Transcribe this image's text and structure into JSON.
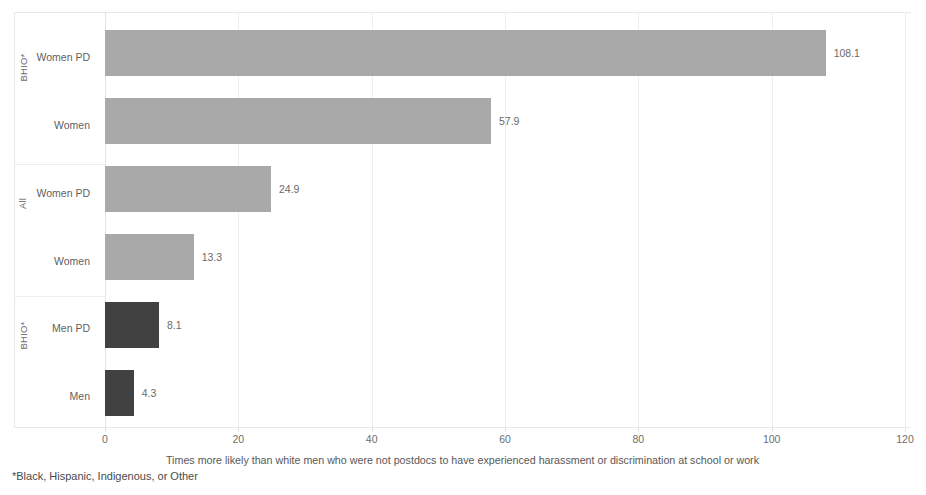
{
  "chart_data": {
    "type": "bar",
    "orientation": "horizontal",
    "title": "",
    "xlabel": "Times more likely than white men who were not postdocs to have experienced harassment or discrimination at school or work",
    "ylabel": "",
    "xlim": [
      0,
      120
    ],
    "xticks": [
      0,
      20,
      40,
      60,
      80,
      100,
      120
    ],
    "xtick_labels": [
      "0",
      "20",
      "40",
      "60",
      "80",
      "100",
      "120"
    ],
    "grid": true,
    "legend": "none",
    "footnote": "*Black, Hispanic, Indigenous, or Other",
    "groups": [
      {
        "name": "BHIO*",
        "categories": [
          "Women PD",
          "Women"
        ],
        "values": [
          108.1,
          57.9
        ],
        "value_labels": [
          "108.1",
          "57.9"
        ],
        "color": "#a9a9a9",
        "shade": "light"
      },
      {
        "name": "All",
        "categories": [
          "Women PD",
          "Women"
        ],
        "values": [
          24.9,
          13.3
        ],
        "value_labels": [
          "24.9",
          "13.3"
        ],
        "color": "#a9a9a9",
        "shade": "light"
      },
      {
        "name": "BHIO*",
        "categories": [
          "Men PD",
          "Men"
        ],
        "values": [
          8.1,
          4.3
        ],
        "value_labels": [
          "8.1",
          "4.3"
        ],
        "color": "#414141",
        "shade": "dark"
      }
    ],
    "categories": [
      "Women PD",
      "Women",
      "Women PD",
      "Women",
      "Men PD",
      "Men"
    ],
    "values": [
      108.1,
      57.9,
      24.9,
      13.3,
      8.1,
      4.3
    ],
    "value_labels": [
      "108.1",
      "57.9",
      "24.9",
      "13.3",
      "8.1",
      "4.3"
    ],
    "bar_colors": [
      "#a9a9a9",
      "#a9a9a9",
      "#a9a9a9",
      "#a9a9a9",
      "#414141",
      "#414141"
    ],
    "group_labels": [
      "BHIO*",
      "All",
      "BHIO*"
    ]
  },
  "colors": {
    "light_bar": "#a9a9a9",
    "dark_bar": "#414141",
    "grid": "#eeeeee",
    "frame": "#e9e9e9",
    "text": "#5a5a5a",
    "background": "#ffffff"
  }
}
